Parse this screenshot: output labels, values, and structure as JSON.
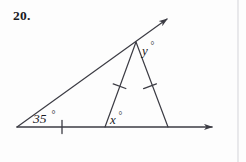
{
  "page": {
    "background_color": "#fdfdfd",
    "ink_color": "#3c3c44",
    "text_color": "#1b1b1f",
    "width": 246,
    "height": 162
  },
  "problem": {
    "number_label": "20.",
    "type": "geometry-angle-diagram"
  },
  "figure": {
    "caption": "Triangle with exterior ray; isosceles sub-triangle marked with congruent tick marks",
    "labels": {
      "base_angle": "35",
      "base_angle_text": "35°",
      "interior_angle_x": "x",
      "interior_angle_x_text": "x°",
      "apex_angle_y": "y",
      "apex_angle_y_text": "y°",
      "degree_symbol": "°"
    },
    "points": {
      "left_vertex": [
        17,
        127
      ],
      "apex": [
        136,
        42
      ],
      "x_vertex": [
        105,
        127
      ],
      "right_foot": [
        168,
        127
      ],
      "upper_ray_tip": [
        173,
        15
      ],
      "base_ray_tip": [
        218,
        127
      ]
    },
    "tick_marks": [
      {
        "name": "base-tick",
        "at": [
          62,
          127
        ],
        "on": "base-segment"
      },
      {
        "name": "left-leg-tick",
        "at": [
          119,
          86
        ],
        "on": "apex-to-x-vertex"
      },
      {
        "name": "right-leg-tick",
        "at": [
          150,
          86
        ],
        "on": "apex-to-right-foot"
      }
    ],
    "arrows": [
      {
        "name": "upper-ray-arrow",
        "direction": "up-right"
      },
      {
        "name": "base-ray-arrow",
        "direction": "right"
      }
    ]
  },
  "artifacts": {
    "page_edge_line_x": 238,
    "ghost_text": "—"
  }
}
